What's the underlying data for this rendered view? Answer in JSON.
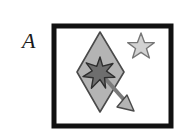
{
  "figure": {
    "panel_label": "A",
    "background_color": "#ffffff",
    "canvas": {
      "width": 185,
      "height": 138
    }
  },
  "frame": {
    "name": "panel-border-box",
    "stroke_color": "#111111",
    "fill_color": "#ffffff",
    "stroke_width": 5,
    "x": 54,
    "y": 26,
    "width": 117,
    "height": 100
  },
  "shapes": {
    "diamond": {
      "label": "diamond",
      "fill_color": "#b4b4b4",
      "stroke_color": "#4a4a4a",
      "stroke_width": 1.6,
      "points": "100,32 124,72 100,112 77,72",
      "center_x": 100,
      "center_y": 72
    },
    "dark_star": {
      "label": "dark-six-pointed-star",
      "points_count": 6,
      "fill_color": "#6e6e6e",
      "stroke_color": "#2e2e2e",
      "stroke_width": 1.4,
      "center_x": 100,
      "center_y": 72,
      "outer_radius": 15,
      "inner_radius": 6.5,
      "rotation_deg": -12
    },
    "light_star": {
      "label": "light-five-pointed-star",
      "points_count": 5,
      "fill_color": "#d2d2d2",
      "stroke_color": "#777777",
      "stroke_width": 1.4,
      "center_x": 141,
      "center_y": 47,
      "outer_radius": 14,
      "inner_radius": 6,
      "rotation_deg": 0
    },
    "arrow": {
      "label": "direction-arrow",
      "shaft_color": "#7a7a7a",
      "shaft_width": 4,
      "head_fill_color": "#b4b4b4",
      "head_stroke_color": "#4a4a4a",
      "start_x": 103,
      "start_y": 76,
      "end_x": 126,
      "end_y": 103,
      "head_points": "133,110 118,106 126,96"
    }
  }
}
